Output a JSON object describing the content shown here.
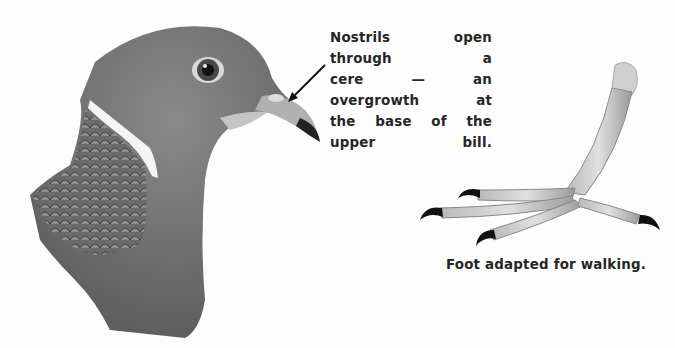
{
  "figure": {
    "head_label": "Pigeon head illustration",
    "foot_label": "Pigeon foot illustration",
    "captions": {
      "nostrils": [
        "Nostrils open through a",
        "cere — an overgrowth at",
        "the base of the upper bill."
      ],
      "foot": "Foot adapted for walking."
    },
    "colors": {
      "background": "#fdfdfd",
      "plumage": "#707070",
      "ink": "#262626"
    }
  }
}
